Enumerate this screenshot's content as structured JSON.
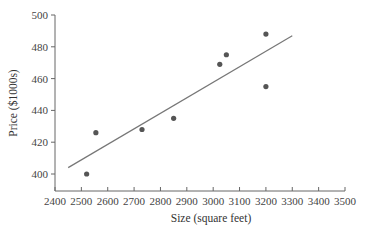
{
  "chart_data": {
    "type": "scatter",
    "title": "",
    "xlabel": "Size (square feet)",
    "ylabel": "Price ($1000s)",
    "xlim": [
      2400,
      3500
    ],
    "ylim": [
      390,
      500
    ],
    "x_ticks": [
      2400,
      2500,
      2600,
      2700,
      2800,
      2900,
      3000,
      3100,
      3200,
      3300,
      3400,
      3500
    ],
    "y_ticks": [
      400,
      420,
      440,
      460,
      480,
      500
    ],
    "grid": false,
    "legend": null,
    "series": [
      {
        "name": "Houses",
        "type": "scatter",
        "points": [
          {
            "x": 2520,
            "y": 400
          },
          {
            "x": 2555,
            "y": 426
          },
          {
            "x": 2730,
            "y": 428
          },
          {
            "x": 2850,
            "y": 435
          },
          {
            "x": 3025,
            "y": 469
          },
          {
            "x": 3050,
            "y": 475
          },
          {
            "x": 3200,
            "y": 488
          },
          {
            "x": 3200,
            "y": 455
          }
        ],
        "color": "#555555"
      },
      {
        "name": "Regression line",
        "type": "line",
        "points": [
          {
            "x": 2450,
            "y": 404
          },
          {
            "x": 3300,
            "y": 487
          }
        ],
        "color": "#777777"
      }
    ]
  }
}
